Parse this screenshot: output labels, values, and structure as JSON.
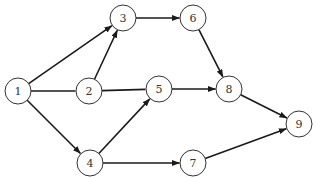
{
  "diagram": {
    "type": "directed-graph",
    "node_radius": 13,
    "colors": {
      "stroke": "#1a1a1a",
      "node_fill": "#ffffff",
      "label": "#333333"
    },
    "nodes": [
      {
        "id": "1",
        "label": "1",
        "x": 18,
        "y": 91
      },
      {
        "id": "2",
        "label": "2",
        "x": 89,
        "y": 91
      },
      {
        "id": "3",
        "label": "3",
        "x": 123,
        "y": 18
      },
      {
        "id": "4",
        "label": "4",
        "x": 90,
        "y": 163
      },
      {
        "id": "5",
        "label": "5",
        "x": 159,
        "y": 89
      },
      {
        "id": "6",
        "label": "6",
        "x": 193,
        "y": 18
      },
      {
        "id": "7",
        "label": "7",
        "x": 193,
        "y": 163
      },
      {
        "id": "8",
        "label": "8",
        "x": 229,
        "y": 89
      },
      {
        "id": "9",
        "label": "9",
        "x": 299,
        "y": 124
      }
    ],
    "edges": [
      {
        "from": "1",
        "to": "3",
        "arrow": true
      },
      {
        "from": "1",
        "to": "2",
        "arrow": false
      },
      {
        "from": "1",
        "to": "4",
        "arrow": true
      },
      {
        "from": "2",
        "to": "3",
        "arrow": true
      },
      {
        "from": "2",
        "to": "5",
        "arrow": false
      },
      {
        "from": "3",
        "to": "6",
        "arrow": true
      },
      {
        "from": "4",
        "to": "5",
        "arrow": true
      },
      {
        "from": "4",
        "to": "7",
        "arrow": true
      },
      {
        "from": "5",
        "to": "8",
        "arrow": true
      },
      {
        "from": "6",
        "to": "8",
        "arrow": true
      },
      {
        "from": "7",
        "to": "9",
        "arrow": true
      },
      {
        "from": "8",
        "to": "9",
        "arrow": true
      }
    ]
  }
}
